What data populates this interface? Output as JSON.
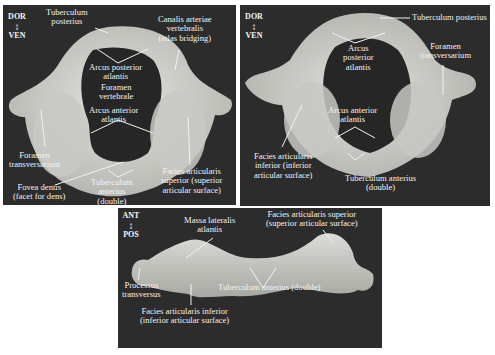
{
  "figure": {
    "panels": [
      {
        "id": "superior-view",
        "orientation": {
          "top": "DOR",
          "bottom": "VEN"
        },
        "labels": [
          {
            "text": "Tuberculum\nposterius"
          },
          {
            "text": "Canalis arteriae\nvertebralis\n(atlas bridging)"
          },
          {
            "text": "Arcus posterior\natlantis"
          },
          {
            "text": "Foramen\nvertebrale"
          },
          {
            "text": "Arcus anterior\natlantis"
          },
          {
            "text": "Foramen\ntransversarium"
          },
          {
            "text": "Facies articularis\nsuperior (superior\narticular surface)"
          },
          {
            "text": "Fovea dentis\n(facet for dens)"
          },
          {
            "text": "Tuberculum\nanterius\n(double)"
          }
        ]
      },
      {
        "id": "inferior-view",
        "orientation": {
          "top": "DOR",
          "bottom": "VEN"
        },
        "labels": [
          {
            "text": "Tuberculum posterius"
          },
          {
            "text": "Arcus\nposterior\natlantis"
          },
          {
            "text": "Foramen\ntransversarium"
          },
          {
            "text": "Arcus anterior\natlantis"
          },
          {
            "text": "Facies articularis\ninferior (inferior\narticular surface)"
          },
          {
            "text": "Tuberculum anterius\n(double)"
          }
        ]
      },
      {
        "id": "anterior-view",
        "orientation": {
          "top": "ANT",
          "bottom": "POS"
        },
        "labels": [
          {
            "text": "Massa lateralis\natlantis"
          },
          {
            "text": "Facies articularis superior\n(superior articular surface)"
          },
          {
            "text": "Processus\ntransversus"
          },
          {
            "text": "Tuberculum anterius (double)"
          },
          {
            "text": "Facies articularis inferior\n(inferior articular surface)"
          }
        ]
      }
    ],
    "colors": {
      "background": "#2c2c2c",
      "bone": "#d9d9d5",
      "bone_shadow": "#a9a9a4",
      "label": "#f2f2f2"
    }
  }
}
